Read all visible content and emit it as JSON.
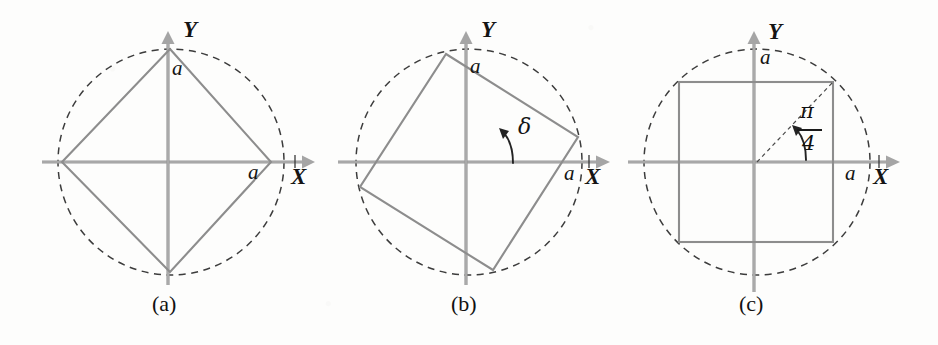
{
  "figure": {
    "background_color": "#fdfdfc",
    "line_color": "#8d8d8d",
    "axis_color": "#9a9a9a",
    "dash_color": "#3c3c3c",
    "ink_color": "#141414"
  },
  "panels": [
    {
      "id": "a",
      "caption": "(a)",
      "axis_x_label": "X",
      "axis_y_label": "Y",
      "side_label_top": "a",
      "side_label_right": "a",
      "shape": "rhombus",
      "shape_vertices": "diamond with vertices on the axes",
      "center": {
        "x": 171,
        "y": 162
      },
      "radius": 113
    },
    {
      "id": "b",
      "caption": "(b)",
      "axis_x_label": "X",
      "axis_y_label": "Y",
      "side_label_top": "a",
      "side_label_right": "a",
      "angle_label": "δ",
      "shape": "rotated-square",
      "rotation_degrees": 31,
      "center": {
        "x": 469,
        "y": 162
      },
      "radius": 113
    },
    {
      "id": "c",
      "caption": "(c)",
      "axis_x_label": "X",
      "axis_y_label": "Y",
      "side_label_top": "a",
      "side_label_right": "a",
      "angle_numerator": "π",
      "angle_denominator": "4",
      "shape": "axis-aligned-square",
      "rotation_degrees": 45,
      "center": {
        "x": 757,
        "y": 162
      },
      "radius": 113
    }
  ]
}
